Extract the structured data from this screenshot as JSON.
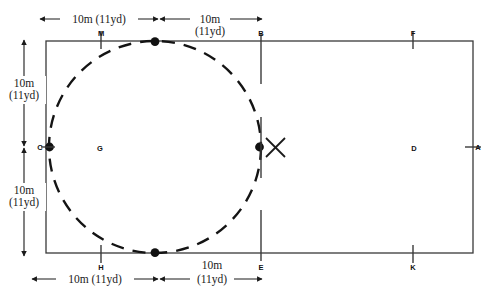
{
  "diagram": {
    "colors": {
      "line": "#333333",
      "dash": "#141414",
      "text": "#1a1a1a",
      "background": "#ffffff"
    },
    "dimensions": {
      "top_left": {
        "line1": "10m (11yd)",
        "line2": ""
      },
      "top_right": {
        "line1": "10m",
        "line2": "(11yd)"
      },
      "left_upper": {
        "line1": "10m",
        "line2": "(11yd)"
      },
      "left_lower": {
        "line1": "10m",
        "line2": "(11yd)"
      },
      "bottom_left": {
        "line1": "10m (11yd)",
        "line2": ""
      },
      "bottom_right": {
        "line1": "10m",
        "line2": "(11yd)"
      }
    },
    "point_labels": {
      "m": "M",
      "b": "B",
      "f": "F",
      "c": "C",
      "a": "A",
      "h": "H",
      "e": "E",
      "k": "K"
    },
    "zone_labels": {
      "g": "G",
      "d": "D"
    },
    "markers": {
      "penalty_spot": "X",
      "dot_top": "circle-top-dot",
      "dot_bottom": "circle-bottom-dot",
      "dot_left": "circle-left-dot",
      "dot_right": "circle-right-dot"
    }
  }
}
